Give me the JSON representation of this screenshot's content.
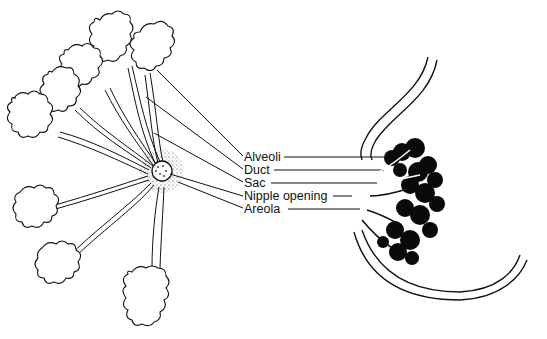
{
  "figure": {
    "labels": [
      {
        "id": "alveoli",
        "text": "Alveoli",
        "x": 244,
        "y": 151
      },
      {
        "id": "duct",
        "text": "Duct",
        "x": 246,
        "y": 166
      },
      {
        "id": "sac",
        "text": "Sac",
        "x": 246,
        "y": 179
      },
      {
        "id": "nipple-opening",
        "text": "Nipple opening",
        "x": 246,
        "y": 193
      },
      {
        "id": "areola",
        "text": "Areola",
        "x": 246,
        "y": 205
      }
    ],
    "colors": {
      "line": "#111111",
      "fill_dark": "#0a0a0a",
      "background": "#ffffff"
    }
  }
}
